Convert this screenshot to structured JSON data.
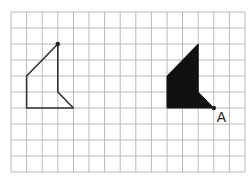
{
  "grid": {
    "columns": 15,
    "rows": 10,
    "origin_x": 11,
    "origin_y": 12,
    "cell_w": 15.6,
    "cell_h": 16,
    "line_color": "#b8b8b8"
  },
  "shapes": [
    {
      "name": "outline-shape",
      "style": "outline",
      "points": [
        [
          3,
          2
        ],
        [
          3,
          5
        ],
        [
          4,
          6
        ],
        [
          1,
          6
        ],
        [
          1,
          4
        ]
      ],
      "stroke": "#333333"
    },
    {
      "name": "filled-shape",
      "style": "filled",
      "points": [
        [
          12,
          2
        ],
        [
          12,
          5
        ],
        [
          13,
          6
        ],
        [
          10,
          6
        ],
        [
          10,
          4
        ]
      ],
      "fill": "#111111"
    }
  ],
  "points": [
    {
      "label": "A",
      "grid": [
        13,
        6
      ]
    },
    {
      "label": "",
      "grid": [
        3,
        2
      ]
    }
  ],
  "labels": {
    "point_a": "A"
  }
}
